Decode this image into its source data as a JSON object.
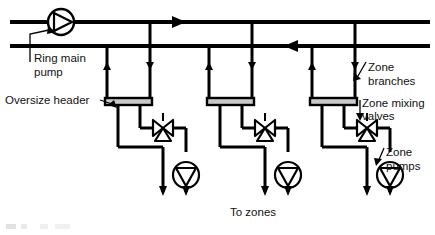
{
  "diagram": {
    "type": "piping-schematic",
    "stroke_color": "#000000",
    "background_color": "#ffffff",
    "header_fill_color": "#c9c9c9"
  },
  "labels": {
    "ring_main_pump": "Ring main\npump",
    "ring_main_pump_line1": "Ring main",
    "ring_main_pump_line2": "pump",
    "oversize_header": "Oversize header",
    "zone_branches_line1": "Zone",
    "zone_branches_line2": "branches",
    "zone_mixing_valves_line1": "Zone mixing",
    "zone_mixing_valves_line2": "valves",
    "zone_pumps_line1": "Zone",
    "zone_pumps_line2": "pumps",
    "to_zones": "To zones"
  },
  "components": {
    "ring_main_pump": {
      "name": "ring-main-pump",
      "symbol": "circle-with-right-triangle",
      "cx": 61,
      "cy": 22,
      "r": 13
    },
    "flow_arrows": [
      {
        "name": "flow-arrow-top-right",
        "direction": "right",
        "x": 178,
        "y": 22
      },
      {
        "name": "flow-arrow-return-left",
        "direction": "left",
        "x": 292,
        "y": 46
      }
    ],
    "headers": [
      {
        "name": "oversize-header-1",
        "x": 105,
        "y": 60,
        "w": 47,
        "h": 44
      },
      {
        "name": "oversize-header-2",
        "x": 207,
        "y": 60,
        "w": 47,
        "h": 44
      },
      {
        "name": "oversize-header-3",
        "x": 310,
        "y": 60,
        "w": 47,
        "h": 44
      }
    ],
    "mixing_valves": [
      {
        "name": "zone-mixing-valve-1",
        "cx": 163,
        "cy": 128
      },
      {
        "name": "zone-mixing-valve-2",
        "cx": 265,
        "cy": 128
      },
      {
        "name": "zone-mixing-valve-3",
        "cx": 367,
        "cy": 128
      }
    ],
    "zone_pumps": [
      {
        "name": "zone-pump-1",
        "cx": 172,
        "cy": 175,
        "r": 12,
        "symbol": "circle-with-down-triangle"
      },
      {
        "name": "zone-pump-2",
        "cx": 274,
        "cy": 175,
        "r": 12,
        "symbol": "circle-with-down-triangle"
      },
      {
        "name": "zone-pump-3",
        "cx": 376,
        "cy": 175,
        "r": 12,
        "symbol": "circle-with-down-triangle"
      }
    ],
    "zone_count": 3
  },
  "pipes": {
    "flow_main_y": 22,
    "return_main_y": 46,
    "main_left_x": 10,
    "main_right_x": 430
  }
}
